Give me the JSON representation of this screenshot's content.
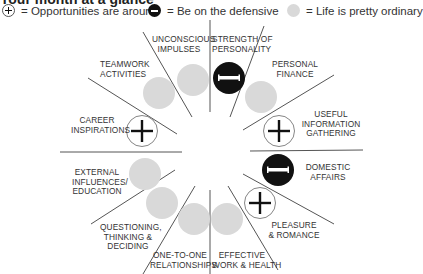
{
  "header": {
    "title": "Your month at a glance"
  },
  "legend": [
    {
      "icon": "plus-circle-icon",
      "label": "= Opportunities are around"
    },
    {
      "icon": "minus-circle-icon",
      "label": "= Be on the defensive"
    },
    {
      "icon": "gray-circle-icon",
      "label": "= Life is pretty ordinary"
    }
  ],
  "colors": {
    "ordinary": "#d9d9d9",
    "defensive": "#111111",
    "line": "#555555"
  },
  "sectors": [
    {
      "label_line1": "UNCONSCIOUS",
      "label_line2": "IMPULSES",
      "label_line3": "",
      "status": "ordinary"
    },
    {
      "label_line1": "STRENGTH OF",
      "label_line2": "PERSONALITY",
      "label_line3": "",
      "status": "defensive"
    },
    {
      "label_line1": "PERSONAL",
      "label_line2": "FINANCE",
      "label_line3": "",
      "status": "ordinary"
    },
    {
      "label_line1": "USEFUL",
      "label_line2": "INFORMATION",
      "label_line3": "GATHERING",
      "status": "opportunity"
    },
    {
      "label_line1": "DOMESTIC",
      "label_line2": "AFFAIRS",
      "label_line3": "",
      "status": "defensive"
    },
    {
      "label_line1": "PLEASURE",
      "label_line2": "& ROMANCE",
      "label_line3": "",
      "status": "opportunity"
    },
    {
      "label_line1": "EFFECTIVE",
      "label_line2": "WORK & HEALTH",
      "label_line3": "",
      "status": "ordinary"
    },
    {
      "label_line1": "ONE-TO-ONE",
      "label_line2": "RELATIONSHIPS",
      "label_line3": "",
      "status": "ordinary"
    },
    {
      "label_line1": "QUESTIONING,",
      "label_line2": "THINKING &",
      "label_line3": "DECIDING",
      "status": "ordinary"
    },
    {
      "label_line1": "EXTERNAL",
      "label_line2": "INFLUENCES/",
      "label_line3": "EDUCATION",
      "status": "ordinary"
    },
    {
      "label_line1": "CAREER",
      "label_line2": "INSPIRATIONS",
      "label_line3": "",
      "status": "opportunity"
    },
    {
      "label_line1": "TEAMWORK",
      "label_line2": "ACTIVITIES",
      "label_line3": "",
      "status": "ordinary"
    }
  ]
}
